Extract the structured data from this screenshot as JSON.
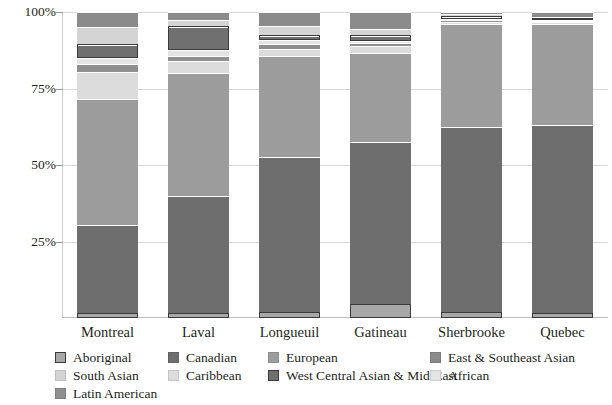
{
  "chart_data": {
    "type": "bar",
    "subtype": "stacked-percentage",
    "title": "",
    "subtitle": "",
    "xlabel": "",
    "ylabel": "",
    "ylim": [
      0,
      100
    ],
    "grid": true,
    "legend_position": "bottom",
    "categories": [
      "Montreal",
      "Laval",
      "Longueuil",
      "Gatineau",
      "Sherbrooke",
      "Quebec"
    ],
    "ytick_labels": [
      "100%",
      "75%",
      "50%",
      "25%"
    ],
    "ytick_values": [
      100,
      75,
      50,
      25
    ],
    "series": [
      {
        "name": "Aboriginal",
        "color": "#a8a8a8",
        "outlined": true,
        "values": [
          1.5,
          1.5,
          2.0,
          4.5,
          2.0,
          1.5
        ]
      },
      {
        "name": "Canadian",
        "color": "#6e6e6e",
        "outlined": false,
        "values": [
          29.0,
          38.5,
          50.5,
          53.0,
          60.5,
          61.5
        ]
      },
      {
        "name": "European",
        "color": "#9c9c9c",
        "outlined": false,
        "values": [
          41.0,
          40.0,
          33.0,
          29.0,
          33.5,
          33.0
        ]
      },
      {
        "name": "Caribbean",
        "color": "#dcdcdc",
        "outlined": false,
        "values": [
          9.0,
          4.0,
          2.5,
          2.5,
          0.8,
          0.6
        ]
      },
      {
        "name": "Latin American",
        "color": "#8f8f8f",
        "outlined": false,
        "values": [
          2.5,
          1.5,
          1.5,
          0.8,
          0.5,
          0.4
        ]
      },
      {
        "name": "African",
        "color": "#e4e4e4",
        "outlined": false,
        "values": [
          2.0,
          2.0,
          1.2,
          0.8,
          0.5,
          0.4
        ]
      },
      {
        "name": "West Central Asian & Mid-East",
        "color": "#707070",
        "outlined": true,
        "values": [
          4.5,
          8.0,
          1.8,
          2.0,
          0.8,
          0.6
        ]
      },
      {
        "name": "South Asian",
        "color": "#d4d4d4",
        "outlined": false,
        "values": [
          5.5,
          1.8,
          2.8,
          2.0,
          0.6,
          0.4
        ]
      },
      {
        "name": "East & Southeast Asian",
        "color": "#8b8b8b",
        "outlined": false,
        "values": [
          5.0,
          2.7,
          4.7,
          5.4,
          0.8,
          1.6
        ]
      }
    ]
  },
  "axes": {
    "y_ticks": [
      {
        "label": "100%",
        "value": 100
      },
      {
        "label": "75%",
        "value": 75
      },
      {
        "label": "50%",
        "value": 50
      },
      {
        "label": "25%",
        "value": 25
      }
    ],
    "x_ticks": [
      {
        "label": "Montreal"
      },
      {
        "label": "Laval"
      },
      {
        "label": "Longueuil"
      },
      {
        "label": "Gatineau"
      },
      {
        "label": "Sherbrooke"
      },
      {
        "label": "Quebec"
      }
    ]
  },
  "legend": {
    "entries": [
      {
        "label": "Aboriginal",
        "color": "#a8a8a8",
        "outlined": true,
        "col": 0,
        "row": 0
      },
      {
        "label": "South Asian",
        "color": "#d4d4d4",
        "outlined": false,
        "col": 0,
        "row": 1
      },
      {
        "label": "Latin American",
        "color": "#8f8f8f",
        "outlined": false,
        "col": 0,
        "row": 2
      },
      {
        "label": "Canadian",
        "color": "#6e6e6e",
        "outlined": false,
        "col": 1,
        "row": 0
      },
      {
        "label": "Caribbean",
        "color": "#dcdcdc",
        "outlined": false,
        "col": 1,
        "row": 1
      },
      {
        "label": "European",
        "color": "#9c9c9c",
        "outlined": false,
        "col": 2,
        "row": 0
      },
      {
        "label": "West Central Asian & Mid-East",
        "color": "#707070",
        "outlined": true,
        "col": 2,
        "row": 1
      },
      {
        "label": "East & Southeast Asian",
        "color": "#8b8b8b",
        "outlined": false,
        "col": 3,
        "row": 0
      },
      {
        "label": "African",
        "color": "#e4e4e4",
        "outlined": false,
        "col": 3,
        "row": 1
      }
    ]
  },
  "colors": {
    "background": "#ffffff",
    "text": "#231f20",
    "gridline": "#d8d8d8",
    "axis": "#bdbdbd",
    "segment_border": "#3b3b3b"
  }
}
